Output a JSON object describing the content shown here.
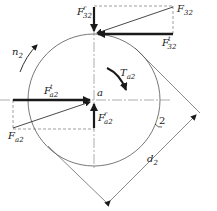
{
  "diagram": {
    "type": "gear force diagram",
    "colors": {
      "line": "#1a1a1a",
      "thin": "#555555",
      "dashed": "#777777",
      "background": "#ffffff"
    },
    "labels": {
      "F32": {
        "base": "F",
        "sub": "32",
        "sup": ""
      },
      "F32r": {
        "base": "F",
        "sub": "32",
        "sup": "r"
      },
      "F32t": {
        "base": "F",
        "sub": "32",
        "sup": "t"
      },
      "Fa2": {
        "base": "F",
        "sub": "a2",
        "sup": ""
      },
      "Fa2t": {
        "base": "F",
        "sub": "a2",
        "sup": "t"
      },
      "Fa2r": {
        "base": "F",
        "sub": "a2",
        "sup": "r"
      },
      "n2": {
        "base": "n",
        "sub": "2"
      },
      "Ta2": {
        "base": "T",
        "sub": "a2"
      },
      "a": "a",
      "gear_number": "2",
      "d2": {
        "base": "d",
        "sub": "2"
      }
    }
  }
}
